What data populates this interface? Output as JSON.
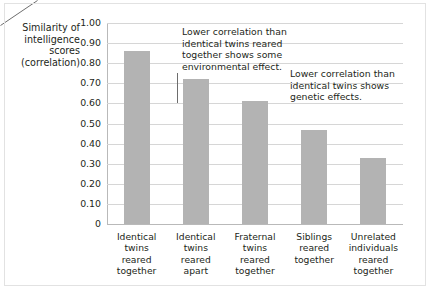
{
  "chart_data": {
    "type": "bar",
    "title": "",
    "xlabel": "",
    "ylabel": "Similarity of intelligence scores (correlation)",
    "ylabel_lines": [
      "Similarity of",
      "intelligence",
      "scores",
      "(correlation)"
    ],
    "categories": [
      "Identical twins reared together",
      "Identical twins reared apart",
      "Fraternal twins reared together",
      "Siblings reared together",
      "Unrelated individuals reared together"
    ],
    "category_lines": [
      [
        "Identical",
        "twins",
        "reared",
        "together"
      ],
      [
        "Identical",
        "twins",
        "reared",
        "apart"
      ],
      [
        "Fraternal",
        "twins",
        "reared",
        "together"
      ],
      [
        "Siblings",
        "reared",
        "together"
      ],
      [
        "Unrelated",
        "individuals",
        "reared",
        "together"
      ]
    ],
    "values": [
      0.86,
      0.72,
      0.61,
      0.47,
      0.33
    ],
    "ylim": [
      0,
      1.0
    ],
    "ytick_values": [
      1.0,
      0.9,
      0.8,
      0.7,
      0.6,
      0.5,
      0.4,
      0.3,
      0.2,
      0.1,
      0
    ],
    "ytick_labels": [
      "1.00",
      "0.90",
      "0.80",
      "0.70",
      "0.60",
      "0.50",
      "0.40",
      "0.30",
      "0.20",
      "0.10",
      "0"
    ],
    "grid": true,
    "legend": "none",
    "bar_color": "#b3b3b3",
    "gridline_color": "#d6d6d6",
    "axis_color": "#b9b9b9",
    "text_color": "#231f20",
    "background_color": "#ffffff",
    "annotations": [
      {
        "id": "environmental",
        "text": "Lower correlation than identical twins reared together shows some environmental effect.",
        "lines": [
          "Lower correlation than",
          "identical twins reared",
          "together shows some",
          "environmental effect."
        ],
        "points_to_category": "Identical twins reared apart"
      },
      {
        "id": "genetic",
        "text": "Lower correlation than identical twins shows genetic effects.",
        "lines": [
          "Lower correlation than",
          "identical twins shows",
          "genetic effects."
        ],
        "points_to_category": "Fraternal twins reared together"
      }
    ]
  }
}
